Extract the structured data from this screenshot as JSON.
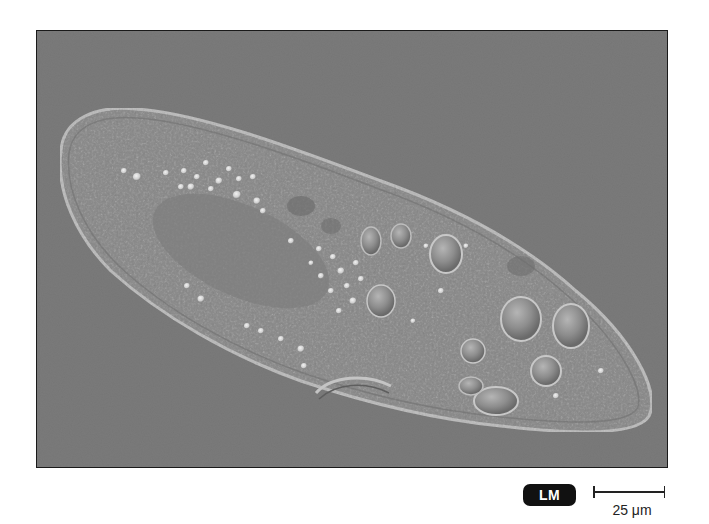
{
  "figure": {
    "background_color": "#7b7b7b",
    "cell_color": "#8a8a8a",
    "frame_border_color": "#1a1a1a"
  },
  "badge": {
    "label": "LM",
    "background_color": "#111111",
    "text_color": "#ffffff"
  },
  "scale": {
    "label": "25 μm",
    "value": 25,
    "unit": "μm"
  }
}
